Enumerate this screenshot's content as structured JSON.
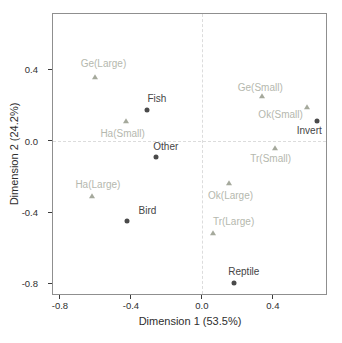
{
  "chart_data": {
    "type": "scatter",
    "title": "",
    "xlabel": "Dimension 1 (53.5%)",
    "ylabel": "Dimension 2 (24.2%)",
    "xlim": [
      -0.845,
      0.705
    ],
    "ylim": [
      -0.865,
      0.715
    ],
    "xticks": [
      {
        "value": -0.8,
        "label": "-0.8"
      },
      {
        "value": -0.4,
        "label": "-0.4"
      },
      {
        "value": 0.0,
        "label": "0.0"
      },
      {
        "value": 0.4,
        "label": "0.4"
      }
    ],
    "yticks": [
      {
        "value": 0.4,
        "label": "0.4"
      },
      {
        "value": 0.0,
        "label": "0.0"
      },
      {
        "value": -0.4,
        "label": "-0.4"
      },
      {
        "value": -0.8,
        "label": "-0.8"
      }
    ],
    "grid": false,
    "legend": "none",
    "reference_lines": [
      {
        "axis": "x",
        "value": 0,
        "style": "dashed",
        "color": "#dcdcdc"
      },
      {
        "axis": "y",
        "value": 0,
        "style": "dashed",
        "color": "#dcdcdc"
      }
    ],
    "series": [
      {
        "name": "prey-categories",
        "marker": "circle",
        "color": "#4a4a4a",
        "label_color": "#454545",
        "points": [
          {
            "label": "Fish",
            "x": -0.31,
            "y": 0.17,
            "label_dx": 10,
            "label_dy": -12
          },
          {
            "label": "Other",
            "x": -0.26,
            "y": -0.09,
            "label_dx": 10,
            "label_dy": -11
          },
          {
            "label": "Bird",
            "x": -0.42,
            "y": -0.45,
            "label_dx": 20,
            "label_dy": -11
          },
          {
            "label": "Invert",
            "x": 0.65,
            "y": 0.11,
            "label_dx": -8,
            "label_dy": 9
          },
          {
            "label": "Reptile",
            "x": 0.18,
            "y": -0.8,
            "label_dx": 10,
            "label_dy": -12
          }
        ]
      },
      {
        "name": "sites",
        "marker": "triangle",
        "color": "#a5a99c",
        "label_color": "#b5b8ae",
        "points": [
          {
            "label": "Ge(Large)",
            "x": -0.6,
            "y": 0.355,
            "label_dx": 8,
            "label_dy": -14
          },
          {
            "label": "Ha(Small)",
            "x": -0.43,
            "y": 0.11,
            "label_dx": -3,
            "label_dy": 12
          },
          {
            "label": "Ha(Large)",
            "x": -0.62,
            "y": -0.31,
            "label_dx": 6,
            "label_dy": -12
          },
          {
            "label": "Ge(Small)",
            "x": 0.34,
            "y": 0.25,
            "label_dx": -2,
            "label_dy": -9
          },
          {
            "label": "Ok(Small)",
            "x": 0.59,
            "y": 0.19,
            "label_dx": -26,
            "label_dy": 7
          },
          {
            "label": "Tr(Small)",
            "x": 0.41,
            "y": -0.04,
            "label_dx": -4,
            "label_dy": 10
          },
          {
            "label": "Ok(Large)",
            "x": 0.15,
            "y": -0.24,
            "label_dx": 2,
            "label_dy": 12
          },
          {
            "label": "Tr(Large)",
            "x": 0.06,
            "y": -0.52,
            "label_dx": 21,
            "label_dy": -12
          }
        ]
      }
    ]
  }
}
